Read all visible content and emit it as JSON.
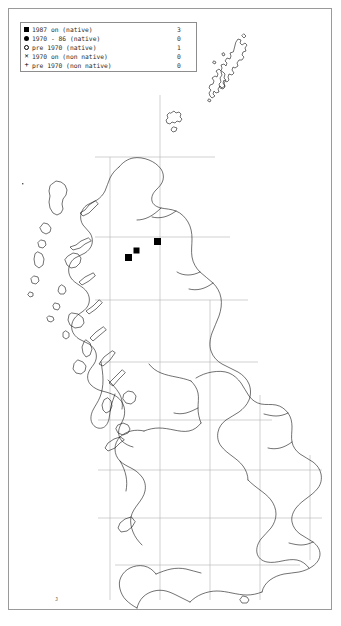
{
  "legend": {
    "rows": [
      {
        "symbol": "filled-square",
        "label": "1987 on (native)",
        "count": "3"
      },
      {
        "symbol": "filled-circle",
        "label": "1970 - 86 (native)",
        "count": "0"
      },
      {
        "symbol": "open-circle",
        "label": "pre 1970 (native)",
        "count": "1"
      },
      {
        "symbol": "cross-x",
        "label": "1970 on (non native)",
        "count": "0"
      },
      {
        "symbol": "plus",
        "label": "pre 1970 (non native)",
        "count": "0"
      }
    ]
  },
  "map": {
    "region": "British Isles",
    "grid_spacing_px": 50,
    "coastline_color": "#1a1a1a",
    "grid_color": "#b4b4b4",
    "marker_color": "#000000",
    "records": [
      {
        "name": "record-scotland-east",
        "x": 157,
        "y": 241,
        "size": 7
      },
      {
        "name": "record-scotland-central",
        "x": 136,
        "y": 250,
        "size": 6
      },
      {
        "name": "record-scotland-west",
        "x": 128,
        "y": 257,
        "size": 7
      }
    ]
  }
}
